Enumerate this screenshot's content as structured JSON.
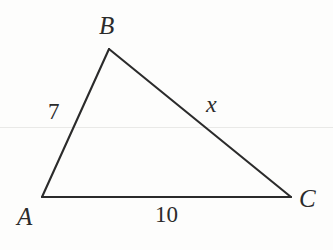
{
  "figure": {
    "type": "geometry-diagram",
    "shape": "triangle",
    "background_color": "#fdfdfc",
    "stroke_color": "#2b2b2b",
    "text_color": "#2b2b2b",
    "artifact_line_color": "#e9e9e7",
    "vertices": [
      {
        "name": "A",
        "label": "A",
        "x": 42,
        "y": 197
      },
      {
        "name": "B",
        "label": "B",
        "x": 109,
        "y": 49
      },
      {
        "name": "C",
        "label": "C",
        "x": 291,
        "y": 197
      }
    ],
    "sides": [
      {
        "name": "AB",
        "from": "A",
        "to": "B",
        "label": "7"
      },
      {
        "name": "BC",
        "from": "B",
        "to": "C",
        "label": "x"
      },
      {
        "name": "AC",
        "from": "A",
        "to": "C",
        "label": "10"
      }
    ],
    "labels": {
      "vertex_a": "A",
      "vertex_b": "B",
      "vertex_c": "C",
      "side_ab": "7",
      "side_bc": "x",
      "side_ac": "10"
    }
  },
  "chart_data": {
    "type": "diagram",
    "title": "",
    "shape": "triangle",
    "points": {
      "A": [
        42,
        197
      ],
      "B": [
        109,
        49
      ],
      "C": [
        291,
        197
      ]
    },
    "edge_labels": {
      "AB": "7",
      "BC": "x",
      "AC": "10"
    },
    "known_values": [
      7,
      10
    ],
    "unknown_values": [
      "x"
    ]
  }
}
